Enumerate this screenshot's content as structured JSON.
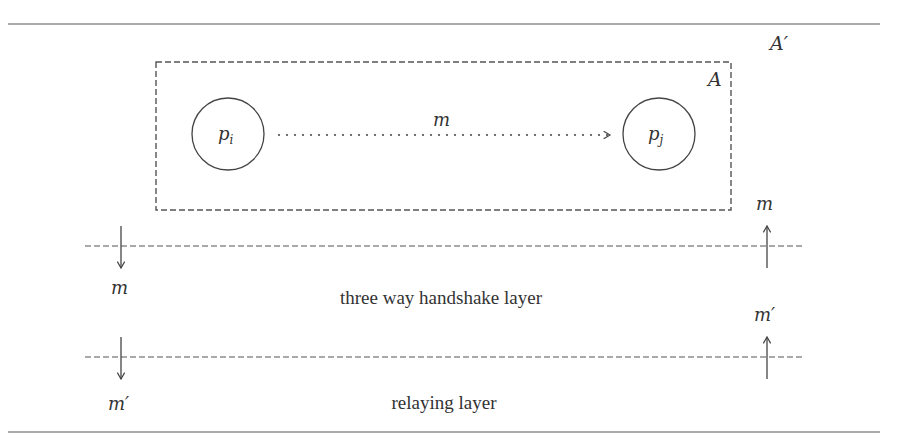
{
  "diagram": {
    "outer_region_label": "A′",
    "inner_region_label": "A",
    "process_i": {
      "label": "p",
      "subscript": "i"
    },
    "process_j": {
      "label": "p",
      "subscript": "j"
    },
    "message_label": "m",
    "layers": [
      {
        "name": "three way handshake layer",
        "down_label": "m",
        "up_label": "m"
      },
      {
        "name": "relaying layer",
        "down_label": "m′",
        "up_label": "m′"
      }
    ]
  },
  "colors": {
    "stroke": "#444444",
    "text": "#333333",
    "background": "#ffffff"
  }
}
